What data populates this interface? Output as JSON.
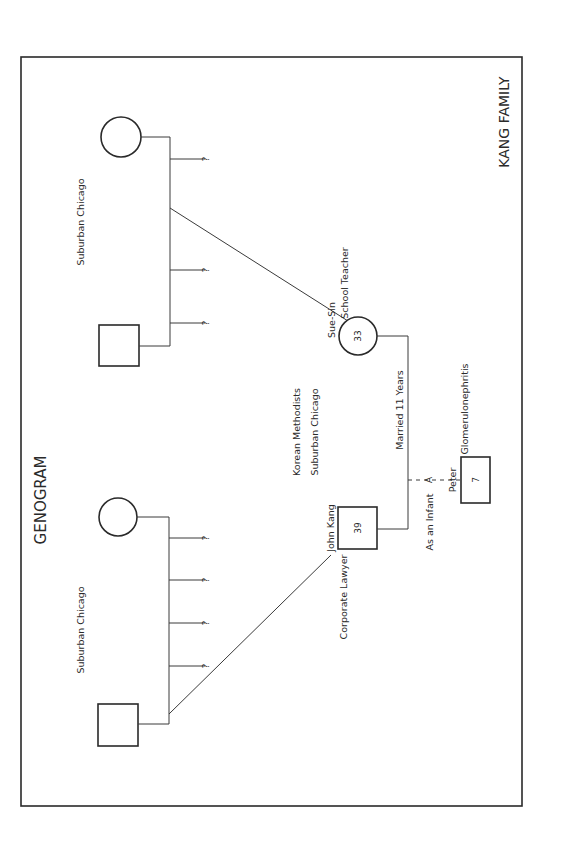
{
  "diagram": {
    "title": "GENOGRAM",
    "family_name": "KANG FAMILY",
    "center_labels": {
      "religion": "Korean Methodists",
      "location": "Suburban Chicago"
    },
    "upper_family": {
      "location": "Suburban Chicago",
      "siblings_unknown": [
        "?",
        "?",
        "?"
      ]
    },
    "lower_family": {
      "location": "Suburban Chicago",
      "siblings_unknown": [
        "?",
        "?",
        "?",
        "?"
      ]
    },
    "wife": {
      "name": "Sue-Sin",
      "age": "33",
      "occupation": "School Teacher"
    },
    "husband": {
      "name": "John Kang",
      "age": "39",
      "occupation": "Corporate Lawyer"
    },
    "marriage": {
      "label": "Married 11 Years"
    },
    "child": {
      "name": "Peter",
      "age": "7",
      "condition": "Glomerulonephritis",
      "adoption_marker": "A",
      "adoption_note": "As an Infant"
    },
    "colors": {
      "ink": "#2a2a2a",
      "background": "#ffffff"
    }
  }
}
